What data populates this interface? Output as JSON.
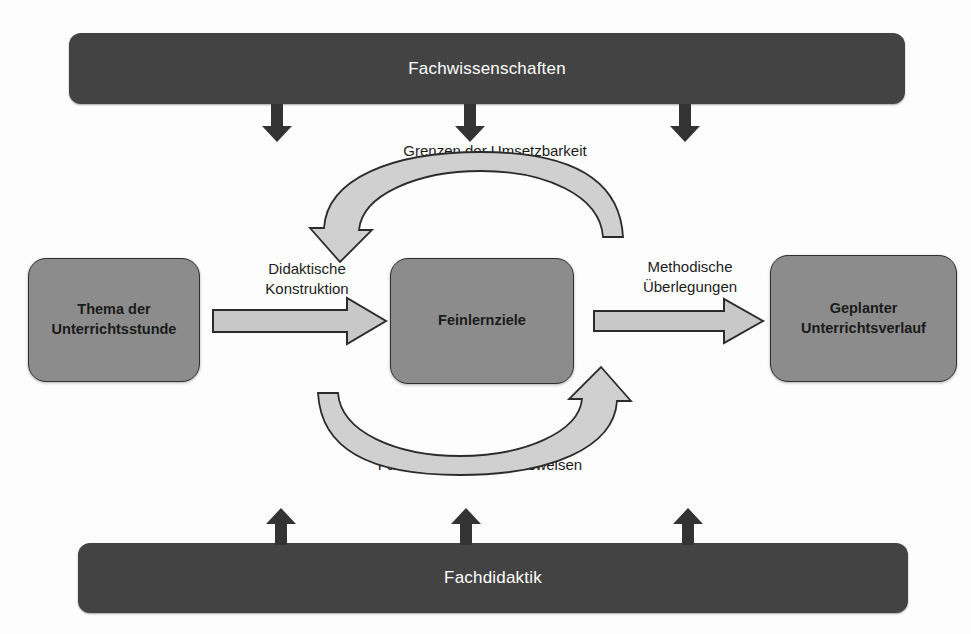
{
  "diagram": {
    "title_top_bar": "Fachwissenschaften",
    "title_bottom_bar": "Fachdidaktik",
    "boxes": [
      {
        "id": "thema",
        "label": "Thema der\nUnterrichtsstunde"
      },
      {
        "id": "feinlernziele",
        "label": "Feinlernziele"
      },
      {
        "id": "geplanter",
        "label": "Geplanter\nUnterrichtsverlauf"
      }
    ],
    "connector_labels": [
      {
        "id": "didaktische-konstruktion",
        "label": "Didaktische\nKonstruktion"
      },
      {
        "id": "methodische-ueberlegungen",
        "label": "Methodische\nÜberlegungen"
      }
    ],
    "curve_labels": [
      {
        "id": "grenzen",
        "label": "Grenzen der Umsetzbarkeit"
      },
      {
        "id": "fachspezifische",
        "label": "Fachspezifische Arbeitsweisen"
      }
    ],
    "icons": {
      "down_arrow": "down-arrow-icon",
      "up_arrow": "up-arrow-icon",
      "block_arrow_right": "block-arrow-right-icon",
      "curved_arrow_left": "curved-arrow-left-icon",
      "curved_arrow_right": "curved-arrow-right-icon"
    },
    "colors": {
      "bar_fill": "#434343",
      "bar_text": "#ffffff",
      "box_fill": "#8c8c8c",
      "box_border": "#2f2f2f",
      "box_text": "#1a1a1a",
      "block_arrow_fill": "#c8c8c8",
      "block_arrow_stroke": "#2b2b2b",
      "tick_arrow_fill": "#333333",
      "label_text": "#1c1c1c",
      "background": "#fdfdfd"
    }
  }
}
